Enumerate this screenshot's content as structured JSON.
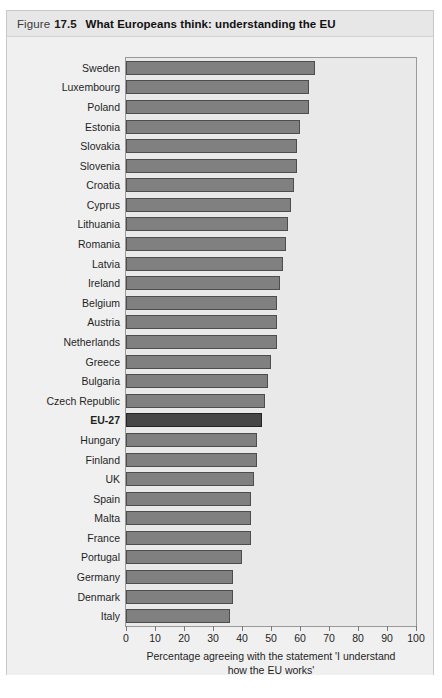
{
  "figure": {
    "label_word": "Figure",
    "number": "17.5",
    "title": "What Europeans think: understanding the EU"
  },
  "chart_data": {
    "type": "bar",
    "orientation": "horizontal",
    "title": "What Europeans think: understanding the EU",
    "xlabel_line1": "Percentage agreeing with the statement 'I understand",
    "xlabel_line2": "how the EU works'",
    "ylabel": "",
    "xlim": [
      0,
      100
    ],
    "xticks": [
      0,
      10,
      20,
      30,
      40,
      50,
      60,
      70,
      80,
      90,
      100
    ],
    "grid": false,
    "legend": "none",
    "highlight_category": "EU-27",
    "bar_color": "#808080",
    "highlight_color": "#474747",
    "categories": [
      "Sweden",
      "Luxembourg",
      "Poland",
      "Estonia",
      "Slovakia",
      "Slovenia",
      "Croatia",
      "Cyprus",
      "Lithuania",
      "Romania",
      "Latvia",
      "Ireland",
      "Belgium",
      "Austria",
      "Netherlands",
      "Greece",
      "Bulgaria",
      "Czech Republic",
      "EU-27",
      "Hungary",
      "Finland",
      "UK",
      "Spain",
      "Malta",
      "France",
      "Portugal",
      "Germany",
      "Denmark",
      "Italy"
    ],
    "values": [
      65,
      63,
      63,
      60,
      59,
      59,
      58,
      57,
      56,
      55,
      54,
      53,
      52,
      52,
      52,
      50,
      49,
      48,
      47,
      45,
      45,
      44,
      43,
      43,
      43,
      40,
      37,
      37,
      36
    ]
  },
  "source": ""
}
